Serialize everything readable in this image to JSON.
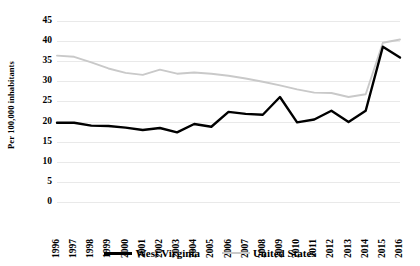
{
  "chart_data": {
    "type": "line",
    "title": "",
    "subtitle": "",
    "xlabel": "",
    "ylabel": "Per 100,000 inhabitants",
    "ylim": [
      0,
      45
    ],
    "yticks": [
      0,
      5,
      10,
      15,
      20,
      25,
      30,
      35,
      40,
      45
    ],
    "grid": true,
    "legend_position": "bottom",
    "categories": [
      "1996",
      "1997",
      "1998",
      "1999",
      "2000",
      "2001",
      "2002",
      "2003",
      "2004",
      "2005",
      "2006",
      "2007",
      "2008",
      "2009",
      "2010",
      "2011",
      "2012",
      "2013",
      "2014",
      "2015",
      "2016"
    ],
    "series": [
      {
        "name": "West Virginia",
        "color": "#000000",
        "values": [
          19.7,
          19.7,
          19.0,
          18.9,
          18.5,
          17.9,
          18.4,
          17.3,
          19.4,
          18.7,
          22.4,
          21.9,
          21.7,
          26.1,
          19.8,
          20.5,
          22.7,
          19.9,
          22.7,
          38.6,
          35.9
        ]
      },
      {
        "name": "United States",
        "color": "#c9c9c9",
        "values": [
          36.4,
          36.1,
          34.7,
          33.2,
          32.1,
          31.6,
          32.9,
          31.9,
          32.2,
          31.9,
          31.4,
          30.7,
          29.9,
          29.0,
          28.0,
          27.2,
          27.1,
          26.1,
          26.8,
          39.6,
          40.4
        ]
      }
    ]
  },
  "axis": {
    "y_title": "Per 100,000 inhabitants"
  },
  "legend": {
    "entries": [
      {
        "label": "West Virginia",
        "icon": "line-swatch-black"
      },
      {
        "label": "United States",
        "icon": "line-swatch-gray"
      }
    ]
  }
}
